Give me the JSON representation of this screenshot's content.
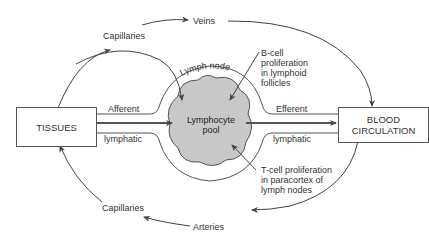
{
  "diagram": {
    "nodes": {
      "tissues": "TISSUES",
      "blood_line1": "BLOOD",
      "blood_line2": "CIRCULATION",
      "pool_line1": "Lymphocyte",
      "pool_line2": "pool",
      "lymph_node": "Lymph node"
    },
    "labels": {
      "capillaries_top": "Capillaries",
      "veins": "Veins",
      "afferent": "Afferent",
      "afferent_lymphatic": "lymphatic",
      "efferent": "Efferent",
      "efferent_lymphatic": "lymphatic",
      "capillaries_bottom": "Capillaries",
      "arteries": "Arteries",
      "bcell_1": "B-cell",
      "bcell_2": "proliferation",
      "bcell_3": "in lymphoid",
      "bcell_4": "follicles",
      "tcell_1": "T-cell proliferation",
      "tcell_2": "in paracortex of",
      "tcell_3": "lymph nodes"
    },
    "colors": {
      "line": "#444444",
      "pool_fill": "#c8c8c8",
      "text": "#333333"
    }
  }
}
